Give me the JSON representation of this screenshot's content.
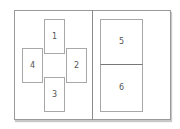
{
  "diagram": {
    "type": "page-layout",
    "left_page": {
      "panels": [
        {
          "id": "1",
          "label": "1",
          "position": "top"
        },
        {
          "id": "2",
          "label": "2",
          "position": "right"
        },
        {
          "id": "3",
          "label": "3",
          "position": "bottom"
        },
        {
          "id": "4",
          "label": "4",
          "position": "left"
        }
      ]
    },
    "right_page": {
      "panels": [
        {
          "id": "5",
          "label": "5",
          "position": "top"
        },
        {
          "id": "6",
          "label": "6",
          "position": "bottom"
        }
      ]
    },
    "colors": {
      "border": "#9a9a9a",
      "panel_border": "#a8a8a8",
      "label": "#555555",
      "background": "#ffffff"
    }
  }
}
